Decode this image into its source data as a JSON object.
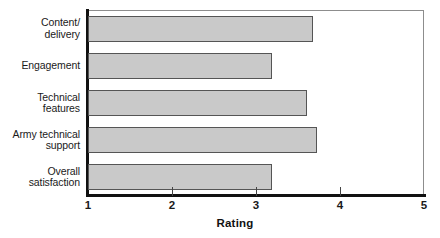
{
  "chart_data": {
    "type": "bar",
    "orientation": "horizontal",
    "title": "",
    "xlabel": "Rating",
    "ylabel": "",
    "categories": [
      "Content/ delivery",
      "Engagement",
      "Technical features",
      "Army technical support",
      "Overall satisfaction"
    ],
    "category_lines": [
      [
        "Content/",
        "delivery"
      ],
      [
        "Engagement"
      ],
      [
        "Technical",
        "features"
      ],
      [
        "Army technical",
        "support"
      ],
      [
        "Overall",
        "satisfaction"
      ]
    ],
    "values": [
      3.68,
      3.19,
      3.61,
      3.73,
      3.19
    ],
    "xlim": [
      1,
      5
    ],
    "xticks": [
      1,
      2,
      3,
      4,
      5
    ],
    "xtick_labels": [
      "1",
      "2",
      "3",
      "4",
      "5"
    ],
    "grid": false,
    "legend": false,
    "bar_fill_color": "#c9c9c9",
    "bar_border_color": "#555555",
    "axis_color": "#111111",
    "frame_color": "#8d8d8d"
  }
}
